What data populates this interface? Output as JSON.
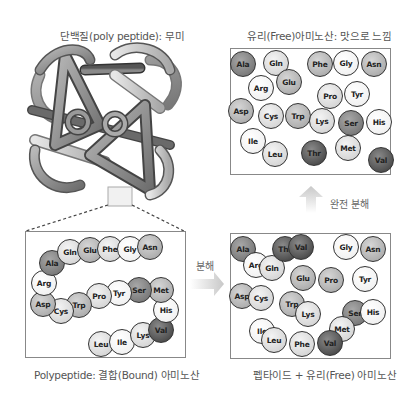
{
  "panels": {
    "protein": {
      "title": "단백질(poly peptide): 무미"
    },
    "free": {
      "title": "유리(Free)아미노산: 맛으로 느낌",
      "amino_acids": [
        {
          "name": "Ala",
          "x": 243,
          "y": 64,
          "shade": "dark"
        },
        {
          "name": "Gln",
          "x": 276,
          "y": 63,
          "shade": "light"
        },
        {
          "name": "Phe",
          "x": 320,
          "y": 64,
          "shade": "mid"
        },
        {
          "name": "Gly",
          "x": 346,
          "y": 63,
          "shade": "white"
        },
        {
          "name": "Asn",
          "x": 374,
          "y": 64,
          "shade": "mid"
        },
        {
          "name": "Arg",
          "x": 261,
          "y": 88,
          "shade": "white"
        },
        {
          "name": "Glu",
          "x": 289,
          "y": 82,
          "shade": "mid"
        },
        {
          "name": "Pro",
          "x": 330,
          "y": 96,
          "shade": "light"
        },
        {
          "name": "Tyr",
          "x": 357,
          "y": 94,
          "shade": "white"
        },
        {
          "name": "Asp",
          "x": 241,
          "y": 111,
          "shade": "mid"
        },
        {
          "name": "Cys",
          "x": 271,
          "y": 116,
          "shade": "light"
        },
        {
          "name": "Trp",
          "x": 298,
          "y": 116,
          "shade": "mid"
        },
        {
          "name": "Lys",
          "x": 322,
          "y": 121,
          "shade": "light"
        },
        {
          "name": "Ser",
          "x": 351,
          "y": 123,
          "shade": "dark"
        },
        {
          "name": "His",
          "x": 379,
          "y": 122,
          "shade": "white"
        },
        {
          "name": "Ile",
          "x": 253,
          "y": 141,
          "shade": "white"
        },
        {
          "name": "Leu",
          "x": 275,
          "y": 154,
          "shade": "light"
        },
        {
          "name": "Thr",
          "x": 314,
          "y": 153,
          "shade": "darkest"
        },
        {
          "name": "Met",
          "x": 348,
          "y": 148,
          "shade": "light"
        },
        {
          "name": "Val",
          "x": 381,
          "y": 160,
          "shade": "darkest"
        }
      ]
    },
    "bound": {
      "title": "Polypeptide: 결합(Bound) 아미노산",
      "amino_acids": [
        {
          "name": "Leu",
          "x": 101,
          "y": 344,
          "shade": "light"
        },
        {
          "name": "Ile",
          "x": 122,
          "y": 342,
          "shade": "white"
        },
        {
          "name": "Lys",
          "x": 143,
          "y": 335,
          "shade": "light"
        },
        {
          "name": "Val",
          "x": 161,
          "y": 330,
          "shade": "darkest"
        },
        {
          "name": "His",
          "x": 166,
          "y": 310,
          "shade": "white"
        },
        {
          "name": "Met",
          "x": 161,
          "y": 290,
          "shade": "mid"
        },
        {
          "name": "Ser",
          "x": 139,
          "y": 290,
          "shade": "dark"
        },
        {
          "name": "Tyr",
          "x": 119,
          "y": 293,
          "shade": "white"
        },
        {
          "name": "Pro",
          "x": 99,
          "y": 296,
          "shade": "light"
        },
        {
          "name": "Trp",
          "x": 79,
          "y": 305,
          "shade": "mid"
        },
        {
          "name": "Cys",
          "x": 61,
          "y": 311,
          "shade": "light"
        },
        {
          "name": "Asp",
          "x": 43,
          "y": 304,
          "shade": "mid"
        },
        {
          "name": "Arg",
          "x": 44,
          "y": 283,
          "shade": "white"
        },
        {
          "name": "Ala",
          "x": 52,
          "y": 263,
          "shade": "dark"
        },
        {
          "name": "Gln",
          "x": 70,
          "y": 252,
          "shade": "light"
        },
        {
          "name": "Glu",
          "x": 90,
          "y": 250,
          "shade": "mid"
        },
        {
          "name": "Phe",
          "x": 110,
          "y": 249,
          "shade": "light"
        },
        {
          "name": "Gly",
          "x": 130,
          "y": 249,
          "shade": "white"
        },
        {
          "name": "Asn",
          "x": 150,
          "y": 247,
          "shade": "mid"
        }
      ]
    },
    "partial": {
      "title": "펩타이드 + 유리(Free) 아미노산",
      "amino_acids": [
        {
          "name": "Ala",
          "x": 243,
          "y": 249,
          "shade": "dark"
        },
        {
          "name": "Arg",
          "x": 256,
          "y": 265,
          "shade": "white"
        },
        {
          "name": "Gln",
          "x": 272,
          "y": 268,
          "shade": "light"
        },
        {
          "name": "Thr",
          "x": 285,
          "y": 249,
          "shade": "darkest"
        },
        {
          "name": "Val",
          "x": 301,
          "y": 247,
          "shade": "darkest"
        },
        {
          "name": "Gly",
          "x": 346,
          "y": 247,
          "shade": "white"
        },
        {
          "name": "Asn",
          "x": 373,
          "y": 249,
          "shade": "mid"
        },
        {
          "name": "Glu",
          "x": 303,
          "y": 278,
          "shade": "mid"
        },
        {
          "name": "Pro",
          "x": 331,
          "y": 280,
          "shade": "mid"
        },
        {
          "name": "Tyr",
          "x": 365,
          "y": 279,
          "shade": "white"
        },
        {
          "name": "Asp",
          "x": 242,
          "y": 296,
          "shade": "mid"
        },
        {
          "name": "Cys",
          "x": 261,
          "y": 298,
          "shade": "light"
        },
        {
          "name": "Trp",
          "x": 292,
          "y": 304,
          "shade": "mid"
        },
        {
          "name": "Lys",
          "x": 308,
          "y": 314,
          "shade": "light"
        },
        {
          "name": "Ser",
          "x": 355,
          "y": 313,
          "shade": "dark"
        },
        {
          "name": "His",
          "x": 373,
          "y": 312,
          "shade": "white"
        },
        {
          "name": "Met",
          "x": 342,
          "y": 329,
          "shade": "light"
        },
        {
          "name": "Ile",
          "x": 262,
          "y": 331,
          "shade": "white"
        },
        {
          "name": "Leu",
          "x": 274,
          "y": 340,
          "shade": "light"
        },
        {
          "name": "Phe",
          "x": 302,
          "y": 344,
          "shade": "light"
        },
        {
          "name": "Val",
          "x": 330,
          "y": 343,
          "shade": "darkest"
        }
      ]
    }
  },
  "arrows": {
    "decompose_label": "분해",
    "full_decompose_label": "완전 분해"
  }
}
